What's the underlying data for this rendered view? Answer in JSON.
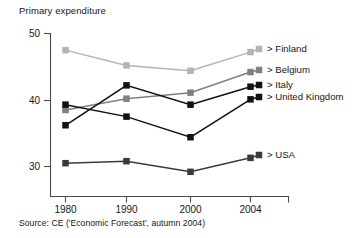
{
  "chart_data": {
    "type": "line",
    "title": "Primary expenditure",
    "xlabel": "",
    "ylabel": "",
    "categories": [
      "1980",
      "1990",
      "2000",
      "2004"
    ],
    "x": [
      1980,
      1990,
      2000,
      2004
    ],
    "ylim": [
      25,
      50
    ],
    "xlim": [
      1975,
      2008
    ],
    "yticks": [
      "50",
      "40",
      "30"
    ],
    "ytick_values": [
      50,
      40,
      30
    ],
    "grid": false,
    "legend_position": "right",
    "legend_prefix": ">",
    "series": [
      {
        "name": "Finland",
        "label": "> Finland",
        "color": "#b4b4b4",
        "values": [
          47.5,
          45.2,
          44.4,
          47.2
        ]
      },
      {
        "name": "Belgium",
        "label": "> Belgium",
        "color": "#808080",
        "values": [
          38.5,
          40.2,
          41.1,
          44.2
        ]
      },
      {
        "name": "Italy",
        "label": "> Italy",
        "color": "#111111",
        "values": [
          36.2,
          42.2,
          39.3,
          42.0
        ]
      },
      {
        "name": "United Kingdom",
        "label": "> United Kingdom",
        "color": "#111111",
        "values": [
          39.3,
          37.5,
          34.4,
          40.1
        ]
      },
      {
        "name": "USA",
        "label": "> USA",
        "color": "#3a3a3a",
        "values": [
          30.5,
          30.8,
          29.2,
          31.3
        ]
      }
    ],
    "source": "Source: CE ('Economic Forecast', autumn 2004)"
  },
  "legend": {
    "items": [
      {
        "label": "> Finland",
        "color": "#b4b4b4"
      },
      {
        "label": "> Belgium",
        "color": "#808080"
      },
      {
        "label": "> Italy",
        "color": "#111111"
      },
      {
        "label": "> United Kingdom",
        "color": "#111111"
      },
      {
        "label": "> USA",
        "color": "#3a3a3a"
      }
    ]
  },
  "axis": {
    "y_ticks": [
      "50",
      "40",
      "30"
    ],
    "x_ticks": [
      "1980",
      "1990",
      "2000",
      "2004"
    ]
  }
}
